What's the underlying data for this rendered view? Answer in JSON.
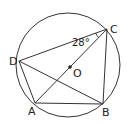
{
  "diagram": {
    "type": "geometry-circle-inscribed-quadrilateral",
    "circle": {
      "center_label": "O",
      "cx": 68,
      "cy": 65,
      "r": 52
    },
    "points": {
      "A": {
        "x": 35,
        "y": 103,
        "label": "A"
      },
      "B": {
        "x": 103,
        "y": 104,
        "label": "B"
      },
      "C": {
        "x": 107,
        "y": 29,
        "label": "C"
      },
      "D": {
        "x": 19,
        "y": 61,
        "label": "D"
      },
      "O": {
        "x": 69,
        "y": 66,
        "label": "O"
      }
    },
    "segments": [
      "AB",
      "BC",
      "CD",
      "DA",
      "AC",
      "DB"
    ],
    "angle": {
      "vertex": "C",
      "between": [
        "CD",
        "CA"
      ],
      "value_label": "28°"
    },
    "stroke_color": "#333333"
  }
}
